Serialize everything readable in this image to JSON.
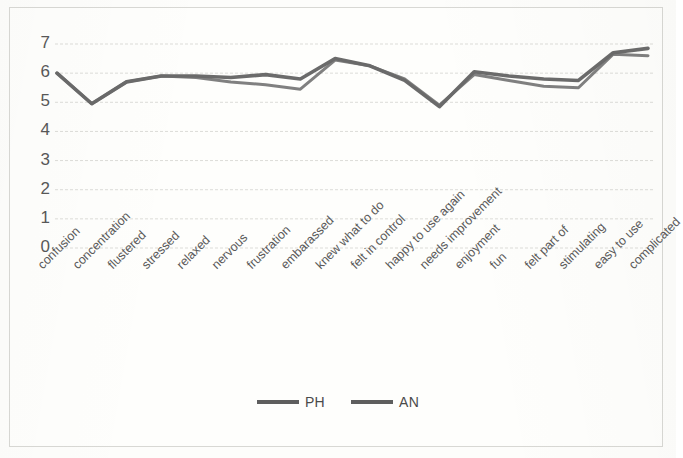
{
  "chart_data": {
    "type": "line",
    "title": "",
    "xlabel": "",
    "ylabel": "",
    "ylim": [
      0,
      7
    ],
    "yticks": [
      7,
      6,
      5,
      4,
      3,
      2,
      1,
      0
    ],
    "grid": true,
    "legend_position": "bottom",
    "categories": [
      "confusion",
      "concentration",
      "flustered",
      "stressed",
      "relaxed",
      "nervous",
      "frustration",
      "embarassed",
      "knew what to do",
      "felt in control",
      "happy to use again",
      "needs improvement",
      "enjoyment",
      "fun",
      "felt part of",
      "stimulating",
      "easy to use",
      "complicated"
    ],
    "series": [
      {
        "name": "PH",
        "color": "#5e5e5e",
        "values": [
          6.0,
          4.95,
          5.7,
          5.9,
          5.9,
          5.85,
          5.95,
          5.8,
          6.5,
          6.25,
          5.75,
          4.85,
          6.05,
          5.9,
          5.8,
          5.75,
          6.7,
          6.85
        ]
      },
      {
        "name": "AN",
        "color": "#6a6a6a",
        "values": [
          6.0,
          4.95,
          5.7,
          5.9,
          5.85,
          5.7,
          5.6,
          5.45,
          6.45,
          6.25,
          5.8,
          4.9,
          5.95,
          5.75,
          5.55,
          5.5,
          6.65,
          6.6
        ]
      }
    ]
  },
  "legend": {
    "items": [
      {
        "label": "PH"
      },
      {
        "label": "AN"
      }
    ]
  }
}
